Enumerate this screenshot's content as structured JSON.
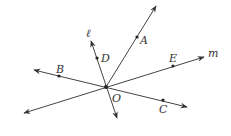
{
  "diagram": {
    "type": "geometry-lines-through-point",
    "colors": {
      "stroke": "#444444",
      "point": "#222222",
      "label": "#333333",
      "background": "#ffffff"
    },
    "center": {
      "label": "O",
      "x": 106,
      "y": 87,
      "label_x": 112,
      "label_y": 102
    },
    "points": [
      {
        "id": "A",
        "label": "A",
        "x": 137,
        "y": 37,
        "label_x": 140,
        "label_y": 44
      },
      {
        "id": "D",
        "label": "D",
        "x": 97,
        "y": 58,
        "label_x": 101,
        "label_y": 62
      },
      {
        "id": "E",
        "label": "E",
        "x": 173,
        "y": 66,
        "label_x": 169,
        "label_y": 62
      },
      {
        "id": "B",
        "label": "B",
        "x": 59,
        "y": 76,
        "label_x": 56,
        "label_y": 73
      },
      {
        "id": "C",
        "label": "C",
        "x": 163,
        "y": 100,
        "label_x": 159,
        "label_y": 113
      }
    ],
    "lines": [
      {
        "name": "ray-OA",
        "label": "",
        "x1": 106,
        "y1": 87,
        "x2": 156,
        "y2": 6,
        "arrows": [
          "end"
        ]
      },
      {
        "name": "line-l",
        "label": "ℓ",
        "x1": 91,
        "y1": 41,
        "x2": 117,
        "y2": 118,
        "arrows": [
          "start",
          "end"
        ],
        "label_x": 86,
        "label_y": 37
      },
      {
        "name": "line-m",
        "label": "m",
        "x1": 24,
        "y1": 113,
        "x2": 204,
        "y2": 57,
        "arrows": [
          "start",
          "end"
        ],
        "label_x": 208,
        "label_y": 57
      },
      {
        "name": "line-BC",
        "label": "",
        "x1": 34,
        "y1": 70,
        "x2": 187,
        "y2": 107,
        "arrows": [
          "start",
          "end"
        ]
      }
    ]
  },
  "labels": {
    "A": "A",
    "B": "B",
    "C": "C",
    "D": "D",
    "E": "E",
    "O": "O",
    "l": "ℓ",
    "m": "m"
  }
}
